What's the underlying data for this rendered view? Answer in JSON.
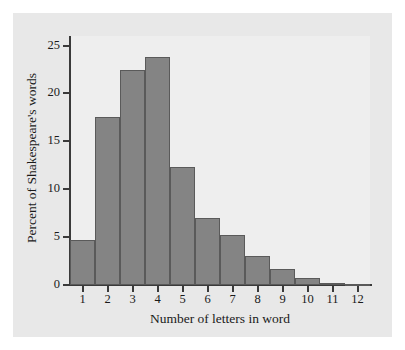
{
  "chart_data": {
    "type": "bar",
    "title": "",
    "xlabel": "Number of letters in word",
    "ylabel": "Percent of Shakespeare's words",
    "categories": [
      "1",
      "2",
      "3",
      "4",
      "5",
      "6",
      "7",
      "8",
      "9",
      "10",
      "11",
      "12"
    ],
    "values": [
      4.7,
      17.5,
      22.4,
      23.8,
      12.3,
      7.0,
      5.2,
      3.0,
      1.7,
      0.7,
      0.2,
      0.1
    ],
    "ylim": [
      0,
      26
    ],
    "xlim": [
      0.5,
      12.5
    ],
    "yticks": [
      0,
      5,
      10,
      15,
      20,
      25
    ],
    "ytick_labels": [
      "0",
      "5",
      "10",
      "15",
      "20",
      "25"
    ],
    "xticks": [
      1,
      2,
      3,
      4,
      5,
      6,
      7,
      8,
      9,
      10,
      11,
      12
    ],
    "xtick_labels": [
      "1",
      "2",
      "3",
      "4",
      "5",
      "6",
      "7",
      "8",
      "9",
      "10",
      "11",
      "12"
    ],
    "grid": false,
    "legend": null,
    "bar_color": "#848484",
    "bar_edge_color": "#5a5a5a",
    "panel_color": "#e8e8e8",
    "plot_color": "#eeeeee",
    "axis_color": "#3a3a3a",
    "page_color": "#ffffff"
  }
}
